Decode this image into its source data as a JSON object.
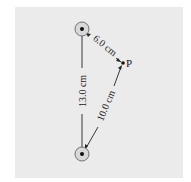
{
  "figure": {
    "background": "#ebebeb",
    "charges": [
      {
        "id": "top",
        "cx": 82,
        "cy": 29
      },
      {
        "id": "bottom",
        "cx": 82,
        "cy": 154
      }
    ],
    "point": {
      "label": "P",
      "cx": 123,
      "cy": 63
    },
    "distances": [
      {
        "id": "top-to-bottom",
        "label": "13.0 cm"
      },
      {
        "id": "top-to-P",
        "label": "6.0 cm"
      },
      {
        "id": "bottom-to-P",
        "label": "10.0 cm"
      }
    ]
  }
}
